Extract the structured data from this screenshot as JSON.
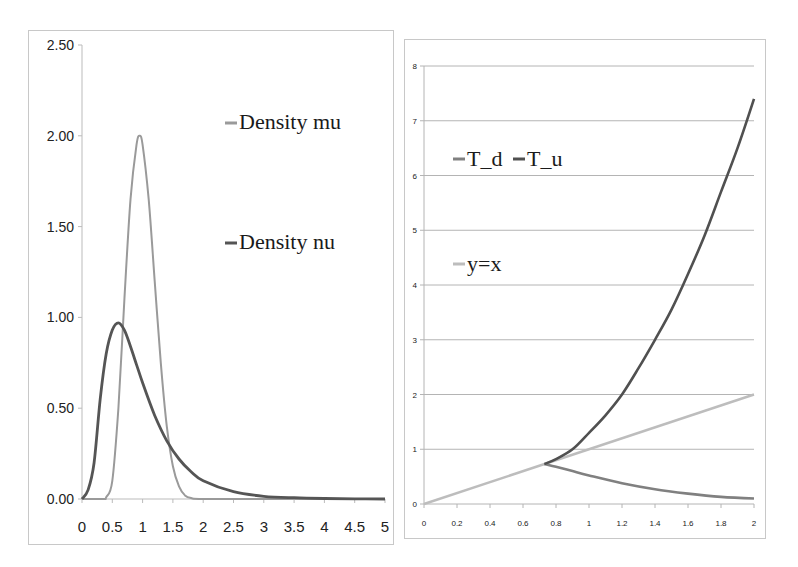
{
  "chart_data": [
    {
      "type": "line",
      "title": "",
      "xlabel": "",
      "ylabel": "",
      "xlim": [
        0,
        5
      ],
      "ylim": [
        0,
        2.5
      ],
      "grid": false,
      "legend_position": "upper right (inside)",
      "x_ticks": [
        "0",
        "0.5",
        "1",
        "1.5",
        "2",
        "2.5",
        "3",
        "3.5",
        "4",
        "4.5",
        "5"
      ],
      "y_ticks": [
        "0.00",
        "0.50",
        "1.00",
        "1.50",
        "2.00",
        "2.50"
      ],
      "series": [
        {
          "name": "Density mu",
          "color": "#9a9a9a",
          "x": [
            0,
            0.35,
            0.4,
            0.5,
            0.6,
            0.7,
            0.8,
            0.9,
            0.95,
            1.0,
            1.1,
            1.2,
            1.3,
            1.4,
            1.5,
            1.6,
            1.7,
            1.8,
            2.0,
            3,
            4,
            5
          ],
          "y": [
            0,
            0,
            0.01,
            0.1,
            0.5,
            1.1,
            1.65,
            1.95,
            2.0,
            1.95,
            1.65,
            1.2,
            0.75,
            0.4,
            0.18,
            0.07,
            0.02,
            0.005,
            0,
            0,
            0,
            0
          ]
        },
        {
          "name": "Density nu",
          "color": "#555555",
          "x": [
            0,
            0.1,
            0.2,
            0.3,
            0.4,
            0.5,
            0.6,
            0.7,
            0.8,
            0.9,
            1.0,
            1.2,
            1.4,
            1.6,
            1.8,
            2.0,
            2.5,
            3.0,
            3.5,
            4.0,
            4.5,
            5.0
          ],
          "y": [
            0,
            0.05,
            0.2,
            0.55,
            0.8,
            0.93,
            0.97,
            0.93,
            0.84,
            0.74,
            0.64,
            0.46,
            0.32,
            0.22,
            0.15,
            0.1,
            0.04,
            0.015,
            0.007,
            0.003,
            0.001,
            0.0
          ]
        }
      ]
    },
    {
      "type": "line",
      "title": "",
      "xlabel": "",
      "ylabel": "",
      "xlim": [
        0,
        2
      ],
      "ylim": [
        0,
        8
      ],
      "grid": true,
      "legend_position": "upper left (inside)",
      "x_ticks": [
        "0",
        "0.2",
        "0.4",
        "0.6",
        "0.8",
        "1",
        "1.2",
        "1.4",
        "1.6",
        "1.8",
        "2"
      ],
      "y_ticks": [
        "0",
        "1",
        "2",
        "3",
        "4",
        "5",
        "6",
        "7",
        "8"
      ],
      "series": [
        {
          "name": "T_d",
          "color": "#808080",
          "x": [
            0.73,
            0.8,
            0.9,
            1.0,
            1.2,
            1.4,
            1.6,
            1.8,
            2.0
          ],
          "y": [
            0.73,
            0.68,
            0.6,
            0.52,
            0.38,
            0.27,
            0.19,
            0.13,
            0.1
          ]
        },
        {
          "name": "T_u",
          "color": "#505050",
          "x": [
            0.73,
            0.8,
            0.9,
            1.0,
            1.1,
            1.2,
            1.3,
            1.4,
            1.5,
            1.6,
            1.7,
            1.8,
            1.9,
            2.0
          ],
          "y": [
            0.73,
            0.82,
            1.0,
            1.3,
            1.62,
            2.0,
            2.48,
            3.0,
            3.55,
            4.2,
            4.9,
            5.7,
            6.5,
            7.4
          ]
        },
        {
          "name": "y=x",
          "color": "#bdbdbd",
          "x": [
            0,
            2
          ],
          "y": [
            0,
            2
          ]
        }
      ]
    }
  ]
}
